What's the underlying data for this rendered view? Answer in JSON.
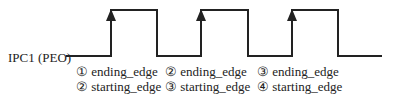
{
  "signal_label": "IPC1 (PEO)",
  "edges": [
    {
      "line1": "① ending_edge",
      "line2": "② starting_edge"
    },
    {
      "line1": "② ending_edge",
      "line2": "③ starting_edge"
    },
    {
      "line1": "③ ending_edge",
      "line2": "④ starting_edge"
    }
  ],
  "colors": {
    "line": "#222222"
  }
}
